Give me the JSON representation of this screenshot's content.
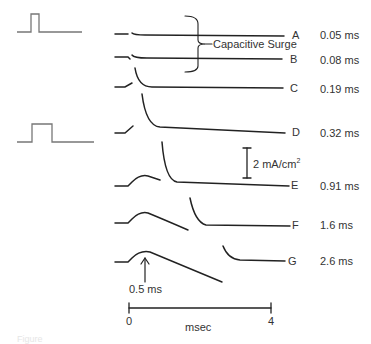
{
  "diagram": {
    "type": "current-traces",
    "annotation_capacitive": "Capacitive Surge",
    "scale_bar_label": "2 mA/cm",
    "scale_bar_sup": "2",
    "arrow_label": "0.5 ms",
    "time_axis": {
      "start": "0",
      "end": "4",
      "unit": "msec"
    },
    "pulses": [
      {
        "name": "short-pulse"
      },
      {
        "name": "long-pulse"
      }
    ],
    "traces": [
      {
        "letter": "A",
        "duration": "0.05 ms"
      },
      {
        "letter": "B",
        "duration": "0.08 ms"
      },
      {
        "letter": "C",
        "duration": "0.19 ms"
      },
      {
        "letter": "D",
        "duration": "0.32 ms"
      },
      {
        "letter": "E",
        "duration": "0.91 ms"
      },
      {
        "letter": "F",
        "duration": "1.6 ms"
      },
      {
        "letter": "G",
        "duration": "2.6 ms"
      }
    ],
    "caption_faint": "Figure"
  }
}
